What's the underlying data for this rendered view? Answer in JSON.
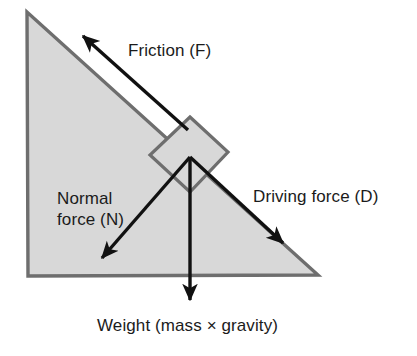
{
  "diagram": {
    "colors": {
      "incline_fill": "#d8d8d8",
      "incline_stroke": "#6e6e6e",
      "block_fill": "#d8d8d8",
      "block_stroke": "#6e6e6e",
      "arrow": "#111111",
      "text": "#1b1b1b",
      "background": "#ffffff"
    },
    "shapes": {
      "incline": {
        "name": "inclined-plane-triangle",
        "points": "27,12 28,276 318,275"
      },
      "block": {
        "name": "block-square",
        "points": "190,117 228,152 190,192 150,155"
      }
    },
    "forces": [
      {
        "id": "friction",
        "label": "Friction (F)",
        "symbol": "F",
        "from_x": 188,
        "from_y": 130,
        "to_x": 83,
        "to_y": 36,
        "direction": "up the slope"
      },
      {
        "id": "normal",
        "label_line_1": "Normal",
        "label_line_2": "force (N)",
        "symbol": "N",
        "from_x": 190,
        "from_y": 157,
        "to_x": 102,
        "to_y": 258,
        "direction": "perpendicular into slope, down-left"
      },
      {
        "id": "driving",
        "label": "Driving force (D)",
        "symbol": "D",
        "from_x": 190,
        "from_y": 157,
        "to_x": 283,
        "to_y": 243,
        "direction": "down the slope"
      },
      {
        "id": "weight",
        "label": "Weight (mass × gravity)",
        "symbol": "W",
        "from_x": 190,
        "from_y": 157,
        "to_x": 190,
        "to_y": 300,
        "direction": "vertically downward"
      }
    ]
  }
}
